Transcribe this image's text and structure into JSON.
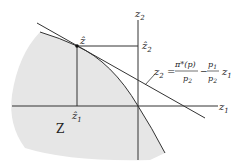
{
  "diagram": {
    "region_label": "Z",
    "axes": {
      "vertical": {
        "label": "z",
        "sub": "2"
      },
      "horizontal": {
        "label": "z",
        "sub": "1"
      }
    },
    "point": {
      "label": "ẑ"
    },
    "point_projections": {
      "z1_hat": {
        "label": "ẑ",
        "sub": "1"
      },
      "z2_hat": {
        "label": "ẑ",
        "sub": "2"
      }
    },
    "equation": {
      "lhs": "z",
      "lhs_sub": "2",
      "equals": "=",
      "frac1_num": "π*(p)",
      "frac1_den": "p",
      "frac1_den_sub": "2",
      "minus": "−",
      "frac2_num": "p",
      "frac2_num_sub": "1",
      "frac2_den": "p",
      "frac2_den_sub": "2",
      "tail": "z",
      "tail_sub": "1"
    },
    "colors": {
      "region_fill": "#e6e6e6",
      "lines": "#333333"
    }
  }
}
